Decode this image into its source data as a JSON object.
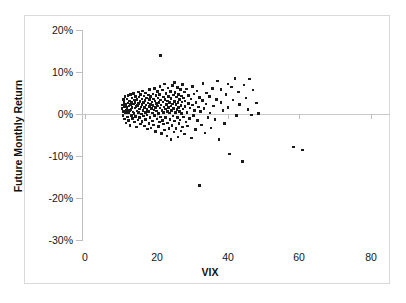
{
  "chart_data": {
    "type": "scatter",
    "title": "",
    "xlabel": "VIX",
    "ylabel": "Future Monthly Return",
    "xlim": [
      0,
      80
    ],
    "ylim": [
      -0.3,
      0.2
    ],
    "grid": false,
    "legend": null,
    "x_ticks": [
      0,
      20,
      40,
      60,
      80
    ],
    "x_tick_labels": [
      "0",
      "20",
      "40",
      "60",
      "80"
    ],
    "y_ticks": [
      0.2,
      0.1,
      0.0,
      -0.1,
      -0.2,
      -0.3
    ],
    "y_tick_labels": [
      "20%",
      "10%",
      "0%",
      "-10%",
      "-20%",
      "-30%"
    ],
    "marker": {
      "shape": "square",
      "color": "#1a1a1a",
      "size": 2.6
    },
    "zero_reference_line": 0.0,
    "series": [
      {
        "name": "VIX vs Future Monthly Return",
        "points": [
          [
            10.3,
            0.013
          ],
          [
            10.5,
            0.021
          ],
          [
            10.6,
            -0.004
          ],
          [
            10.7,
            0.034
          ],
          [
            10.8,
            0.006
          ],
          [
            10.9,
            0.028
          ],
          [
            11.0,
            -0.012
          ],
          [
            11.1,
            0.017
          ],
          [
            11.2,
            0.041
          ],
          [
            11.3,
            0.002
          ],
          [
            11.4,
            0.023
          ],
          [
            11.5,
            -0.021
          ],
          [
            11.6,
            0.009
          ],
          [
            11.7,
            0.036
          ],
          [
            11.8,
            0.015
          ],
          [
            11.9,
            -0.007
          ],
          [
            12.0,
            0.026
          ],
          [
            12.0,
            0.044
          ],
          [
            12.1,
            0.004
          ],
          [
            12.2,
            -0.016
          ],
          [
            12.3,
            0.019
          ],
          [
            12.4,
            0.031
          ],
          [
            12.5,
            0.008
          ],
          [
            12.6,
            -0.027
          ],
          [
            12.7,
            0.022
          ],
          [
            12.8,
            0.046
          ],
          [
            12.9,
            0.011
          ],
          [
            13.0,
            -0.003
          ],
          [
            13.0,
            0.029
          ],
          [
            13.1,
            0.016
          ],
          [
            13.2,
            0.038
          ],
          [
            13.3,
            -0.011
          ],
          [
            13.4,
            0.005
          ],
          [
            13.5,
            0.024
          ],
          [
            13.6,
            0.049
          ],
          [
            13.7,
            0.001
          ],
          [
            13.8,
            -0.019
          ],
          [
            13.9,
            0.033
          ],
          [
            14.0,
            0.014
          ],
          [
            14.0,
            0.027
          ],
          [
            14.1,
            -0.006
          ],
          [
            14.2,
            0.042
          ],
          [
            14.3,
            0.018
          ],
          [
            14.4,
            -0.031
          ],
          [
            14.5,
            0.007
          ],
          [
            14.6,
            0.035
          ],
          [
            14.7,
            0.02
          ],
          [
            14.8,
            -0.014
          ],
          [
            14.9,
            0.052
          ],
          [
            15.0,
            0.003
          ],
          [
            15.0,
            0.025
          ],
          [
            15.1,
            0.04
          ],
          [
            15.2,
            -0.009
          ],
          [
            15.3,
            0.012
          ],
          [
            15.4,
            0.03
          ],
          [
            15.5,
            -0.024
          ],
          [
            15.6,
            0.047
          ],
          [
            15.7,
            0.017
          ],
          [
            15.8,
            0.0
          ],
          [
            15.9,
            0.036
          ],
          [
            16.0,
            -0.018
          ],
          [
            16.0,
            0.022
          ],
          [
            16.1,
            0.055
          ],
          [
            16.2,
            0.009
          ],
          [
            16.3,
            -0.005
          ],
          [
            16.4,
            0.028
          ],
          [
            16.5,
            0.043
          ],
          [
            16.6,
            -0.029
          ],
          [
            16.7,
            0.015
          ],
          [
            16.8,
            0.032
          ],
          [
            16.9,
            0.004
          ],
          [
            17.0,
            -0.013
          ],
          [
            17.0,
            0.05
          ],
          [
            17.1,
            0.021
          ],
          [
            17.2,
            0.038
          ],
          [
            17.3,
            -0.002
          ],
          [
            17.4,
            0.011
          ],
          [
            17.5,
            -0.036
          ],
          [
            17.6,
            0.026
          ],
          [
            17.7,
            0.045
          ],
          [
            17.8,
            0.006
          ],
          [
            17.9,
            -0.022
          ],
          [
            18.0,
            0.034
          ],
          [
            18.0,
            0.018
          ],
          [
            18.1,
            0.058
          ],
          [
            18.2,
            -0.008
          ],
          [
            18.3,
            0.023
          ],
          [
            18.4,
            0.041
          ],
          [
            18.5,
            -0.033
          ],
          [
            18.6,
            0.013
          ],
          [
            18.7,
            0.029
          ],
          [
            18.8,
            0.002
          ],
          [
            18.9,
            -0.017
          ],
          [
            19.0,
            0.048
          ],
          [
            19.0,
            0.02
          ],
          [
            19.1,
            0.036
          ],
          [
            19.2,
            -0.026
          ],
          [
            19.3,
            0.01
          ],
          [
            19.4,
            0.061
          ],
          [
            19.5,
            -0.004
          ],
          [
            19.6,
            0.031
          ],
          [
            19.7,
            0.016
          ],
          [
            19.8,
            -0.041
          ],
          [
            19.9,
            0.044
          ],
          [
            20.0,
            0.007
          ],
          [
            20.0,
            0.025
          ],
          [
            20.1,
            -0.012
          ],
          [
            20.2,
            0.053
          ],
          [
            20.3,
            0.019
          ],
          [
            20.4,
            0.038
          ],
          [
            20.5,
            -0.03
          ],
          [
            20.6,
            0.001
          ],
          [
            20.7,
            0.027
          ],
          [
            20.8,
            -0.019
          ],
          [
            20.9,
            0.046
          ],
          [
            21.0,
            0.014
          ],
          [
            21.0,
            0.066
          ],
          [
            21.1,
            -0.007
          ],
          [
            21.2,
            0.033
          ],
          [
            21.2,
            0.139
          ],
          [
            21.3,
            0.021
          ],
          [
            21.4,
            -0.046
          ],
          [
            21.5,
            0.009
          ],
          [
            21.6,
            0.057
          ],
          [
            21.7,
            -0.015
          ],
          [
            21.8,
            0.029
          ],
          [
            21.9,
            0.04
          ],
          [
            22.0,
            0.004
          ],
          [
            22.0,
            -0.024
          ],
          [
            22.1,
            0.017
          ],
          [
            22.2,
            0.071
          ],
          [
            22.3,
            -0.038
          ],
          [
            22.4,
            0.035
          ],
          [
            22.5,
            0.012
          ],
          [
            22.6,
            -0.009
          ],
          [
            22.7,
            0.049
          ],
          [
            22.8,
            0.023
          ],
          [
            22.9,
            -0.052
          ],
          [
            23.0,
            0.006
          ],
          [
            23.0,
            0.031
          ],
          [
            23.1,
            -0.021
          ],
          [
            23.2,
            0.062
          ],
          [
            23.3,
            0.015
          ],
          [
            23.4,
            0.042
          ],
          [
            23.5,
            -0.034
          ],
          [
            23.6,
            0.002
          ],
          [
            23.7,
            0.027
          ],
          [
            23.8,
            -0.013
          ],
          [
            23.9,
            0.054
          ],
          [
            24.0,
            0.019
          ],
          [
            24.0,
            -0.061
          ],
          [
            24.1,
            0.037
          ],
          [
            24.2,
            0.008
          ],
          [
            24.3,
            -0.027
          ],
          [
            24.4,
            0.068
          ],
          [
            24.5,
            0.024
          ],
          [
            24.6,
            -0.005
          ],
          [
            24.7,
            0.045
          ],
          [
            24.8,
            0.013
          ],
          [
            24.9,
            -0.043
          ],
          [
            25.0,
            0.03
          ],
          [
            25.0,
            0.075
          ],
          [
            25.1,
            -0.017
          ],
          [
            25.2,
            0.051
          ],
          [
            25.3,
            0.003
          ],
          [
            25.4,
            0.022
          ],
          [
            25.5,
            -0.035
          ],
          [
            25.6,
            0.04
          ],
          [
            25.7,
            0.011
          ],
          [
            25.8,
            -0.009
          ],
          [
            25.9,
            0.063
          ],
          [
            26.0,
            0.027
          ],
          [
            26.0,
            -0.055
          ],
          [
            26.1,
            0.016
          ],
          [
            26.2,
            0.047
          ],
          [
            26.3,
            -0.023
          ],
          [
            26.4,
            0.006
          ],
          [
            26.5,
            0.034
          ],
          [
            26.6,
            -0.014
          ],
          [
            26.7,
            0.058
          ],
          [
            26.8,
            0.02
          ],
          [
            26.9,
            -0.04
          ],
          [
            27.0,
            0.043
          ],
          [
            27.0,
            0.001
          ],
          [
            27.1,
            0.029
          ],
          [
            27.2,
            -0.031
          ],
          [
            27.3,
            0.07
          ],
          [
            27.4,
            0.012
          ],
          [
            27.5,
            -0.007
          ],
          [
            27.6,
            0.038
          ],
          [
            27.8,
            0.052
          ],
          [
            27.9,
            -0.048
          ],
          [
            28.0,
            0.018
          ],
          [
            28.0,
            0.031
          ],
          [
            28.2,
            -0.019
          ],
          [
            28.4,
            0.06
          ],
          [
            28.5,
            0.004
          ],
          [
            28.7,
            -0.029
          ],
          [
            28.9,
            0.025
          ],
          [
            29.0,
            0.044
          ],
          [
            29.2,
            -0.011
          ],
          [
            29.4,
            0.014
          ],
          [
            29.6,
            0.036
          ],
          [
            29.8,
            -0.057
          ],
          [
            30.0,
            0.021
          ],
          [
            30.0,
            0.066
          ],
          [
            30.3,
            -0.003
          ],
          [
            30.5,
            0.048
          ],
          [
            30.7,
            0.009
          ],
          [
            30.9,
            -0.037
          ],
          [
            31.0,
            0.028
          ],
          [
            31.3,
            0.055
          ],
          [
            31.5,
            -0.016
          ],
          [
            31.8,
            0.017
          ],
          [
            32.0,
            0.039
          ],
          [
            32.0,
            -0.17
          ],
          [
            32.3,
            0.006
          ],
          [
            32.6,
            -0.026
          ],
          [
            32.9,
            0.032
          ],
          [
            33.0,
            0.072
          ],
          [
            33.3,
            0.013
          ],
          [
            33.6,
            -0.045
          ],
          [
            33.9,
            0.024
          ],
          [
            34.0,
            0.05
          ],
          [
            34.4,
            -0.008
          ],
          [
            34.8,
            0.041
          ],
          [
            35.0,
            0.002
          ],
          [
            35.3,
            -0.033
          ],
          [
            35.7,
            0.061
          ],
          [
            36.0,
            0.019
          ],
          [
            36.4,
            -0.013
          ],
          [
            36.8,
            0.035
          ],
          [
            37.0,
            0.079
          ],
          [
            37.5,
            -0.061
          ],
          [
            38.0,
            0.027
          ],
          [
            38.0,
            0.058
          ],
          [
            38.6,
            0.008
          ],
          [
            39.0,
            -0.022
          ],
          [
            39.4,
            0.046
          ],
          [
            40.0,
            0.071
          ],
          [
            40.0,
            0.015
          ],
          [
            40.5,
            -0.095
          ],
          [
            41.0,
            0.064
          ],
          [
            41.4,
            0.033
          ],
          [
            42.0,
            0.085
          ],
          [
            42.3,
            -0.004
          ],
          [
            43.0,
            0.052
          ],
          [
            43.2,
            0.022
          ],
          [
            44.0,
            -0.113
          ],
          [
            44.5,
            0.069
          ],
          [
            45.0,
            0.038
          ],
          [
            45.6,
            0.011
          ],
          [
            46.0,
            0.083
          ],
          [
            46.5,
            -0.002
          ],
          [
            47.0,
            0.057
          ],
          [
            48.0,
            0.026
          ],
          [
            48.5,
            0.0005
          ],
          [
            58.4,
            -0.079
          ],
          [
            60.8,
            -0.086
          ]
        ]
      }
    ]
  },
  "figure": {
    "axis_line_color": "#bfbfbf",
    "zero_line_color": "#c9c9c9",
    "border_color": "#d9d9d9",
    "text_color": "#151515",
    "marker_color": "#1a1a1a"
  }
}
